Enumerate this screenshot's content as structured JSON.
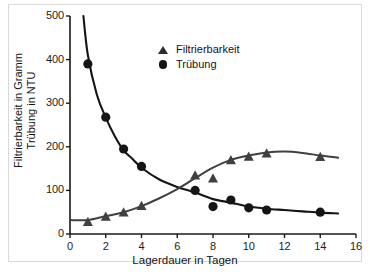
{
  "figure": {
    "border_color": "#d9d9d9",
    "background": "#ffffff"
  },
  "axes": {
    "x_label": "Lagerdauer in Tagen",
    "y_label_line1": "Filtrierbarkeit in Gramm",
    "y_label_line2": "Trübung in NTU",
    "x_ticks": [
      "0",
      "2",
      "4",
      "6",
      "8",
      "10",
      "12",
      "14",
      "16"
    ],
    "y_ticks": [
      "0",
      "100",
      "200",
      "300",
      "400",
      "500"
    ]
  },
  "legend": {
    "position": "upper-center",
    "entries": [
      {
        "label": "Filtrierbarkeit",
        "marker": "triangle-up",
        "color": "#2b2b2b"
      },
      {
        "label": "Trübung",
        "marker": "circle",
        "color": "#151515"
      }
    ]
  },
  "chart_data": {
    "type": "scatter",
    "title": "",
    "xlabel": "Lagerdauer in Tagen",
    "ylabel": "Filtrierbarkeit in Gramm / Trübung in NTU",
    "xlim": [
      0,
      16
    ],
    "ylim": [
      0,
      500
    ],
    "xticks": [
      0,
      2,
      4,
      6,
      8,
      10,
      12,
      14,
      16
    ],
    "yticks": [
      0,
      100,
      200,
      300,
      400,
      500
    ],
    "grid": false,
    "legend_position": "upper center",
    "series": [
      {
        "name": "Filtrierbarkeit",
        "marker": "triangle-up",
        "color": "#404040",
        "unit": "Gramm",
        "x": [
          1,
          2,
          3,
          4,
          7,
          8,
          9,
          10,
          11,
          14
        ],
        "y": [
          28,
          40,
          50,
          65,
          135,
          128,
          170,
          178,
          185,
          177
        ],
        "fit_curve": {
          "x": [
            0,
            1,
            2,
            3,
            4,
            5,
            6,
            7,
            8,
            9,
            10,
            11,
            12,
            13,
            14,
            15
          ],
          "y": [
            32,
            32,
            41,
            50,
            64,
            82,
            103,
            128,
            152,
            170,
            180,
            187,
            189,
            186,
            180,
            175
          ]
        }
      },
      {
        "name": "Trübung",
        "marker": "circle",
        "color": "#151515",
        "unit": "NTU",
        "x": [
          1,
          2,
          3,
          4,
          7,
          8,
          9,
          10,
          11,
          14
        ],
        "y": [
          390,
          268,
          195,
          155,
          100,
          63,
          78,
          60,
          55,
          50
        ],
        "fit_curve": {
          "x": [
            0.75,
            1,
            1.5,
            2,
            2.5,
            3,
            3.5,
            4,
            5,
            6,
            7,
            8,
            9,
            10,
            11,
            12,
            13,
            14,
            15
          ],
          "y": [
            500,
            410,
            320,
            267,
            225,
            192,
            172,
            152,
            125,
            108,
            95,
            80,
            72,
            63,
            58,
            55,
            52,
            49,
            47
          ]
        }
      }
    ]
  }
}
